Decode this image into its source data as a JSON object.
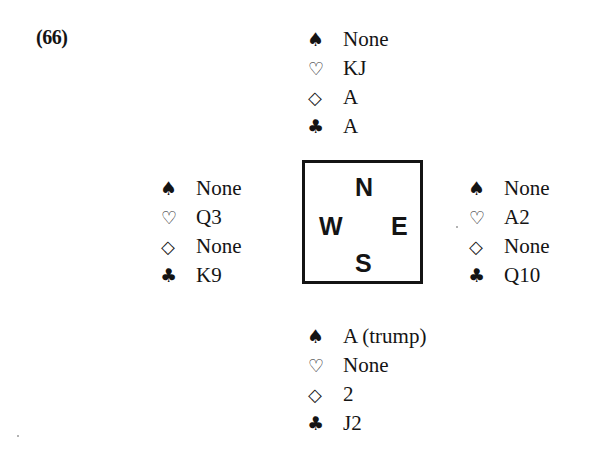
{
  "problem": {
    "number": "(66)"
  },
  "suit_icons": {
    "spade": "♠",
    "heart": "♡",
    "diamond": "◇",
    "club": "♣"
  },
  "hands": {
    "north": {
      "spades": "None",
      "hearts": "KJ",
      "diamonds": "A",
      "clubs": "A"
    },
    "west": {
      "spades": "None",
      "hearts": "Q3",
      "diamonds": "None",
      "clubs": "K9"
    },
    "east": {
      "spades": "None",
      "hearts": "A2",
      "diamonds": "None",
      "clubs": "Q10"
    },
    "south": {
      "spades": "A (trump)",
      "hearts": "None",
      "diamonds": "2",
      "clubs": "J2"
    }
  },
  "compass": {
    "north": "N",
    "west": "W",
    "east": "E",
    "south": "S"
  }
}
